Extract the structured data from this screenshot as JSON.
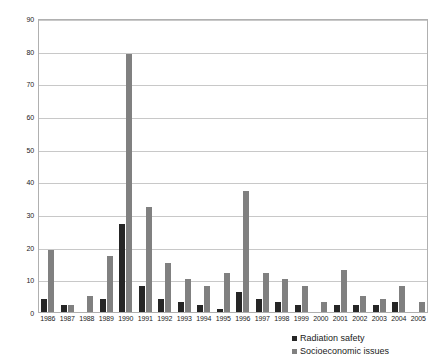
{
  "chart_data": {
    "type": "bar",
    "title": "",
    "subtitle": "",
    "xlabel": "",
    "ylabel": "",
    "ylim": [
      0,
      90
    ],
    "ytick_step": 10,
    "yticks": [
      0,
      10,
      20,
      30,
      40,
      50,
      60,
      70,
      80,
      90
    ],
    "grid": true,
    "legend_position": "bottom-right",
    "categories": [
      "1986",
      "1987",
      "1988",
      "1989",
      "1990",
      "1991",
      "1992",
      "1993",
      "1994",
      "1995",
      "1996",
      "1997",
      "1998",
      "1999",
      "2000",
      "2001",
      "2002",
      "2003",
      "2004",
      "2005"
    ],
    "series": [
      {
        "name": "Radiation safety",
        "color": "#262626",
        "values": [
          4,
          2,
          0,
          4,
          27,
          8,
          4,
          3,
          2,
          1,
          6,
          4,
          3,
          2,
          0,
          2,
          2,
          2,
          3,
          0
        ]
      },
      {
        "name": "Socioeconomic issues",
        "color": "#808080",
        "values": [
          19,
          2,
          5,
          17,
          79,
          32,
          15,
          10,
          8,
          12,
          37,
          12,
          10,
          8,
          3,
          13,
          5,
          4,
          8,
          3
        ]
      }
    ]
  },
  "legend": {
    "items": [
      {
        "label": "Radiation safety",
        "color": "#262626",
        "marker": "square-marker-icon"
      },
      {
        "label": "Socioeconomic issues",
        "color": "#808080",
        "marker": "square-marker-icon"
      }
    ]
  },
  "axes": {
    "y_tick_labels": [
      "0",
      "10",
      "20",
      "30",
      "40",
      "50",
      "60",
      "70",
      "80",
      "90"
    ],
    "x_tick_labels": [
      "1986",
      "1987",
      "1988",
      "1989",
      "1990",
      "1991",
      "1992",
      "1993",
      "1994",
      "1995",
      "1996",
      "1997",
      "1998",
      "1999",
      "2000",
      "2001",
      "2002",
      "2003",
      "2004",
      "2005"
    ]
  }
}
